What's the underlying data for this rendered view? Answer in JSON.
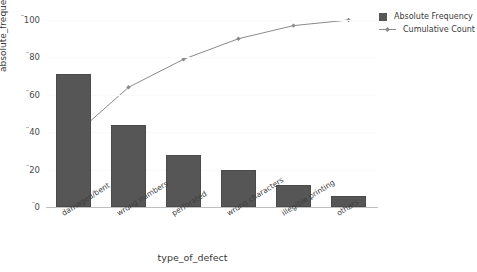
{
  "chart_data": {
    "type": "bar",
    "title": "",
    "categories": [
      "damaged/bent",
      "wrong numbers",
      "perforated",
      "wrong characters",
      "illegible printing",
      "others"
    ],
    "values": [
      71,
      44,
      28,
      20,
      12,
      6
    ],
    "series": [
      {
        "name": "Absolute Frequency",
        "type": "bar",
        "values": [
          71,
          44,
          28,
          20,
          12,
          6
        ]
      },
      {
        "name": "Cumulative Count",
        "type": "line",
        "values": [
          38,
          64,
          79,
          90,
          97,
          100
        ]
      }
    ],
    "xlabel": "type_of_defect",
    "ylabel": "absolute_frequency",
    "ylim": [
      0,
      100
    ],
    "yticks": [
      "0",
      "20",
      "40",
      "60",
      "80",
      "100"
    ],
    "grid": true,
    "legend_position": "top-right",
    "colors": {
      "bar": "#565656",
      "line": "#8a8a8a",
      "text": "#3a3a3a",
      "axis": "#bfbfbf"
    }
  },
  "legend": {
    "items": [
      {
        "label": "Absolute Frequency"
      },
      {
        "label": "Cumulative Count"
      }
    ]
  },
  "axes": {
    "y_label": "absolute_frequency",
    "x_label": "type_of_defect"
  }
}
